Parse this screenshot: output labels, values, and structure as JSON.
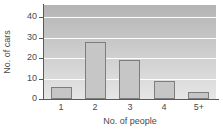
{
  "chart_data": {
    "type": "bar",
    "title": "",
    "subtitle": "",
    "xlabel": "No. of people",
    "ylabel": "No. of cars",
    "categories": [
      "1",
      "2",
      "3",
      "4",
      "5+"
    ],
    "values": [
      6,
      28,
      19,
      9,
      3.5
    ],
    "series": [
      {
        "name": "No. of cars",
        "values": [
          6,
          28,
          19,
          9,
          3.5
        ]
      }
    ],
    "ylim": [
      0,
      46
    ],
    "y_ticks": [
      0,
      10,
      20,
      30,
      40
    ],
    "y_tick_labels": [
      "0",
      "10",
      "20",
      "30",
      "40"
    ],
    "xlim_categories": 5,
    "grid": true,
    "grid_orientation": "horizontal",
    "gridline_values": [
      10,
      20,
      30,
      40
    ],
    "legend": false,
    "legend_position": "none",
    "annotations": [],
    "colors": {
      "bar_fill": "#c6c6c6",
      "bar_border": "#7d7d7d",
      "plot_background_top": "#b4b4b4",
      "plot_background_bottom": "#e6e6e6",
      "gridline": "#fdfdfd",
      "axis_line": "#5a5a5a",
      "text": "#4a4a4a",
      "page_background": "#ffffff"
    }
  }
}
